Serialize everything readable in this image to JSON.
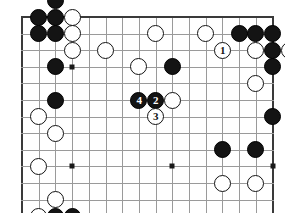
{
  "diagram": {
    "kind": "go-board-diagram",
    "board_size": 19,
    "visible_columns": 16,
    "visible_rows": 12,
    "colors": {
      "background": "#ffffff",
      "grid_line": "#9a9a9a",
      "border_line": "#3a3a3a",
      "black_stone": "#141414",
      "white_stone": "#ffffff",
      "stone_outline": "#121212",
      "hoshi": "#1a1a1a"
    },
    "geometry": {
      "origin_x": 22,
      "origin_y": 17,
      "step_x": 16.7,
      "step_y": 16.6,
      "stone_diameter": 17
    },
    "hoshi_points": [
      {
        "col": 3,
        "row": 3
      },
      {
        "col": 9,
        "row": 3
      },
      {
        "col": 15,
        "row": 3
      },
      {
        "col": 3,
        "row": 9
      },
      {
        "col": 9,
        "row": 9
      },
      {
        "col": 15,
        "row": 9
      }
    ],
    "stones": [
      {
        "col": 2,
        "row": -1,
        "color": "black",
        "label": ""
      },
      {
        "col": 1,
        "row": 0,
        "color": "black",
        "label": ""
      },
      {
        "col": 2,
        "row": 0,
        "color": "black",
        "label": ""
      },
      {
        "col": 3,
        "row": 0,
        "color": "white",
        "label": ""
      },
      {
        "col": 1,
        "row": 1,
        "color": "black",
        "label": ""
      },
      {
        "col": 2,
        "row": 1,
        "color": "black",
        "label": ""
      },
      {
        "col": 3,
        "row": 1,
        "color": "white",
        "label": ""
      },
      {
        "col": 3,
        "row": 2,
        "color": "white",
        "label": ""
      },
      {
        "col": 5,
        "row": 2,
        "color": "white",
        "label": ""
      },
      {
        "col": 7,
        "row": 3,
        "color": "white",
        "label": ""
      },
      {
        "col": 2,
        "row": 3,
        "color": "black",
        "label": ""
      },
      {
        "col": 2,
        "row": 5,
        "color": "black",
        "label": ""
      },
      {
        "col": 1,
        "row": 6,
        "color": "white",
        "label": ""
      },
      {
        "col": 2,
        "row": 7,
        "color": "white",
        "label": ""
      },
      {
        "col": 1,
        "row": 9,
        "color": "white",
        "label": ""
      },
      {
        "col": 2,
        "row": 11,
        "color": "white",
        "label": ""
      },
      {
        "col": 1,
        "row": 12,
        "color": "white",
        "label": ""
      },
      {
        "col": 2,
        "row": 12,
        "color": "black",
        "label": ""
      },
      {
        "col": 3,
        "row": 12,
        "color": "black",
        "label": ""
      },
      {
        "col": 8,
        "row": 1,
        "color": "white",
        "label": ""
      },
      {
        "col": 11,
        "row": 1,
        "color": "white",
        "label": ""
      },
      {
        "col": 12,
        "row": 2,
        "color": "white",
        "label": "1"
      },
      {
        "col": 13,
        "row": 1,
        "color": "black",
        "label": ""
      },
      {
        "col": 14,
        "row": 1,
        "color": "black",
        "label": ""
      },
      {
        "col": 15,
        "row": 1,
        "color": "black",
        "label": ""
      },
      {
        "col": 14,
        "row": 2,
        "color": "white",
        "label": ""
      },
      {
        "col": 15,
        "row": 2,
        "color": "black",
        "label": ""
      },
      {
        "col": 16,
        "row": 2,
        "color": "white",
        "label": ""
      },
      {
        "col": 15,
        "row": 3,
        "color": "black",
        "label": ""
      },
      {
        "col": 9,
        "row": 3,
        "color": "black",
        "label": ""
      },
      {
        "col": 14,
        "row": 4,
        "color": "white",
        "label": ""
      },
      {
        "col": 7,
        "row": 5,
        "color": "black",
        "label": "4"
      },
      {
        "col": 8,
        "row": 5,
        "color": "black",
        "label": "2"
      },
      {
        "col": 9,
        "row": 5,
        "color": "white",
        "label": ""
      },
      {
        "col": 8,
        "row": 6,
        "color": "white",
        "label": "3"
      },
      {
        "col": 15,
        "row": 6,
        "color": "black",
        "label": ""
      },
      {
        "col": 12,
        "row": 8,
        "color": "black",
        "label": ""
      },
      {
        "col": 14,
        "row": 8,
        "color": "black",
        "label": ""
      },
      {
        "col": 12,
        "row": 10,
        "color": "white",
        "label": ""
      },
      {
        "col": 14,
        "row": 10,
        "color": "white",
        "label": ""
      }
    ],
    "move_sequence": [
      {
        "number": "1",
        "color": "white"
      },
      {
        "number": "2",
        "color": "black"
      },
      {
        "number": "3",
        "color": "white"
      },
      {
        "number": "4",
        "color": "black"
      }
    ]
  }
}
